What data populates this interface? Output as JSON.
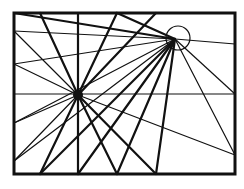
{
  "diagram": {
    "title": "",
    "canvas": {
      "width": 244,
      "height": 189,
      "background": "#ffffff"
    },
    "stroke_color": "#111111",
    "frame": {
      "x1": 14,
      "y1": 13,
      "x2": 235,
      "y2": 174
    },
    "focal_points": [
      {
        "id": "left-vanishing-point",
        "x": 78,
        "y": 95,
        "style": "filled-dot",
        "radius": 5
      },
      {
        "id": "right-vanishing-point",
        "x": 175,
        "y": 39,
        "style": "open-circle",
        "radius": 12,
        "circle_center": [
          178,
          38
        ]
      }
    ],
    "horizon_line": {
      "y": 94,
      "x1": 14,
      "x2": 235
    },
    "rays_from_left_point": [
      {
        "to": [
          40,
          13
        ],
        "weight": "thick"
      },
      {
        "to": [
          78,
          13
        ],
        "weight": "thick"
      },
      {
        "to": [
          117,
          13
        ],
        "weight": "thick"
      },
      {
        "to": [
          156,
          13
        ],
        "weight": "thick"
      },
      {
        "to": [
          40,
          174
        ],
        "weight": "thick"
      },
      {
        "to": [
          78,
          174
        ],
        "weight": "thick"
      },
      {
        "to": [
          117,
          174
        ],
        "weight": "thick"
      },
      {
        "to": [
          156,
          174
        ],
        "weight": "thick"
      },
      {
        "to": [
          14,
          31
        ],
        "weight": "thin"
      },
      {
        "to": [
          14,
          64
        ],
        "weight": "thin"
      },
      {
        "to": [
          14,
          123
        ],
        "weight": "thin"
      },
      {
        "to": [
          14,
          161
        ],
        "weight": "thin"
      },
      {
        "to": [
          235,
          155
        ],
        "weight": "thin"
      }
    ],
    "rays_from_right_point": [
      {
        "to": [
          14,
          13
        ],
        "weight": "thick"
      },
      {
        "to": [
          117,
          13
        ],
        "weight": "thick"
      },
      {
        "to": [
          14,
          31
        ],
        "weight": "thin"
      },
      {
        "to": [
          14,
          64
        ],
        "weight": "thin"
      },
      {
        "to": [
          14,
          123
        ],
        "weight": "thin"
      },
      {
        "to": [
          14,
          161
        ],
        "weight": "thin"
      },
      {
        "to": [
          40,
          174
        ],
        "weight": "thick"
      },
      {
        "to": [
          78,
          174
        ],
        "weight": "thick"
      },
      {
        "to": [
          117,
          174
        ],
        "weight": "thick"
      },
      {
        "to": [
          156,
          174
        ],
        "weight": "thick"
      },
      {
        "to": [
          235,
          44
        ],
        "weight": "thin"
      },
      {
        "to": [
          235,
          94
        ],
        "weight": "thin"
      },
      {
        "to": [
          235,
          155
        ],
        "weight": "thin"
      }
    ]
  }
}
